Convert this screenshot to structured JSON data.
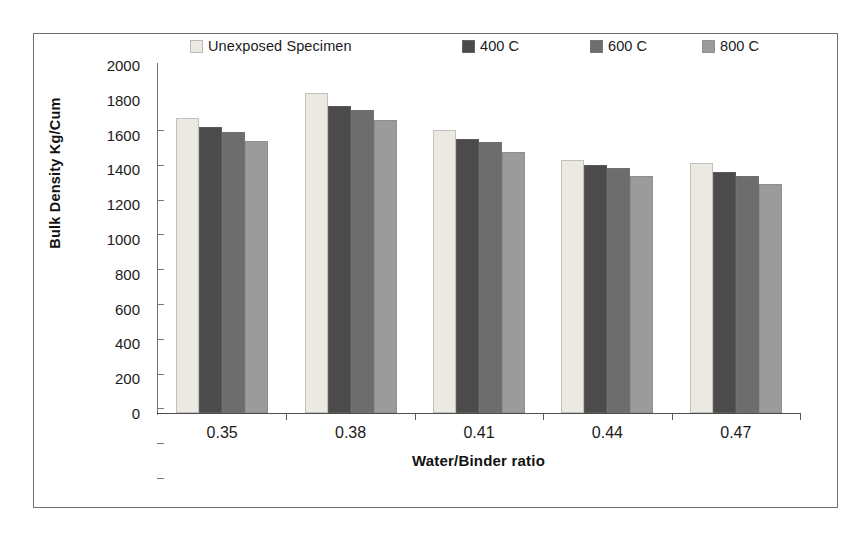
{
  "chart_data": {
    "type": "bar",
    "title": "",
    "xlabel": "Water/Binder ratio",
    "ylabel": "Bulk Density Kg/Cum",
    "categories": [
      "0.35",
      "0.38",
      "0.41",
      "0.44",
      "0.47"
    ],
    "ylim": [
      0,
      2000
    ],
    "yticks": [
      "0",
      "200",
      "400",
      "600",
      "800",
      "1000",
      "1200",
      "1400",
      "1600",
      "1800",
      "2000"
    ],
    "grid": false,
    "legend_position": "top",
    "series": [
      {
        "name": "Unexposed Specimen",
        "color": "#ece9e3",
        "values": [
          1695,
          1840,
          1625,
          1455,
          1435
        ]
      },
      {
        "name": "400 C",
        "color": "#4b4b4b",
        "values": [
          1645,
          1765,
          1575,
          1425,
          1385
        ]
      },
      {
        "name": "600 C",
        "color": "#6d6d6d",
        "values": [
          1615,
          1740,
          1560,
          1410,
          1360
        ]
      },
      {
        "name": "800 C",
        "color": "#9b9b9b",
        "values": [
          1565,
          1685,
          1500,
          1360,
          1315
        ]
      }
    ]
  },
  "legend": {
    "items": [
      {
        "label": "Unexposed Specimen",
        "swatch": "#ece9e3"
      },
      {
        "label": "400 C",
        "swatch": "#4b4b4b"
      },
      {
        "label": "600 C",
        "swatch": "#6d6d6d"
      },
      {
        "label": "800 C",
        "swatch": "#9b9b9b"
      }
    ]
  },
  "axes": {
    "y_title": "Bulk Density Kg/Cum",
    "x_title": "Water/Binder ratio"
  }
}
